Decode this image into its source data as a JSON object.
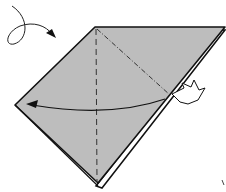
{
  "diagram": {
    "type": "origami-step",
    "colors": {
      "paper": "#bdbdbd",
      "line": "#111111",
      "background": "#ffffff"
    },
    "paper_shape": {
      "vertices": {
        "top": [
          95,
          27
        ],
        "top_right": [
          225,
          27
        ],
        "left": [
          15,
          105
        ],
        "bottom": [
          98,
          185
        ]
      }
    },
    "annotations": [
      {
        "name": "turn-over-arrow",
        "meaning": "turn model over"
      },
      {
        "name": "valley-fold-line",
        "meaning": "vertical valley fold"
      },
      {
        "name": "mountain-fold-line",
        "meaning": "diagonal mountain fold"
      },
      {
        "name": "fold-arrow",
        "meaning": "fold right flap to the left"
      },
      {
        "name": "push-arrow",
        "meaning": "push / squash point"
      }
    ]
  }
}
